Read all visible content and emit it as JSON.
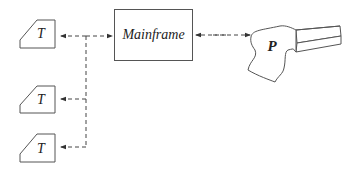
{
  "diagram": {
    "mainframe": {
      "label": "Mainframe"
    },
    "printer": {
      "label": "P"
    },
    "terminals": [
      {
        "label": "T"
      },
      {
        "label": "T"
      },
      {
        "label": "T"
      }
    ],
    "colors": {
      "stroke": "#555555",
      "text": "#222222"
    }
  }
}
